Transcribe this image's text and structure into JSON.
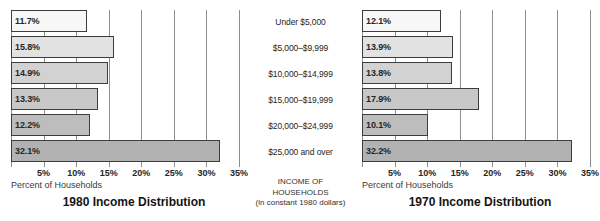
{
  "axis": {
    "ticks": [
      "5%",
      "10%",
      "15%",
      "20%",
      "25%",
      "30%",
      "35%"
    ],
    "tick_values": [
      5,
      10,
      15,
      20,
      25,
      30,
      35
    ],
    "caption": "Percent of Households",
    "min": 0,
    "max": 35
  },
  "center": {
    "categories": [
      "Under $5,000",
      "$5,000–$9,999",
      "$10,000–$14,999",
      "$15,000–$19,999",
      "$20,000–$24,999",
      "$25,000 and over"
    ],
    "footer_line1": "INCOME OF",
    "footer_line2": "HOUSEHOLDS",
    "footer_line3": "(in constant 1980 dollars)"
  },
  "left_chart": {
    "title": "1980 Income Distribution",
    "labels": [
      "11.7%",
      "15.8%",
      "14.9%",
      "13.3%",
      "12.2%",
      "32.1%"
    ]
  },
  "right_chart": {
    "title": "1970 Income Distribution",
    "labels": [
      "12.1%",
      "13.9%",
      "13.8%",
      "17.9%",
      "10.1%",
      "32.2%"
    ]
  },
  "chart_data": [
    {
      "type": "bar",
      "orientation": "horizontal",
      "title": "1980 Income Distribution",
      "xlabel": "Percent of Households",
      "ylabel": "INCOME OF HOUSEHOLDS (in constant 1980 dollars)",
      "categories": [
        "Under $5,000",
        "$5,000–$9,999",
        "$10,000–$14,999",
        "$15,000–$19,999",
        "$20,000–$24,999",
        "$25,000 and over"
      ],
      "values": [
        11.7,
        15.8,
        14.9,
        13.3,
        12.2,
        32.1
      ],
      "data_labels": [
        "11.7%",
        "15.8%",
        "14.9%",
        "13.3%",
        "12.2%",
        "32.1%"
      ],
      "bar_colors": [
        "#f7f7f7",
        "#e2e2e2",
        "#d2d2d2",
        "#c8c8c8",
        "#bdbdbd",
        "#b2b2b2"
      ],
      "xlim": [
        0,
        35
      ],
      "xticks": [
        5,
        10,
        15,
        20,
        25,
        30,
        35
      ],
      "xticklabels": [
        "5%",
        "10%",
        "15%",
        "20%",
        "25%",
        "30%",
        "35%"
      ],
      "grid": true,
      "legend": "none"
    },
    {
      "type": "bar",
      "orientation": "horizontal",
      "title": "1970 Income Distribution",
      "xlabel": "Percent of Households",
      "ylabel": "INCOME OF HOUSEHOLDS (in constant 1980 dollars)",
      "categories": [
        "Under $5,000",
        "$5,000–$9,999",
        "$10,000–$14,999",
        "$15,000–$19,999",
        "$20,000–$24,999",
        "$25,000 and over"
      ],
      "values": [
        12.1,
        13.9,
        13.8,
        17.9,
        10.1,
        32.2
      ],
      "data_labels": [
        "12.1%",
        "13.9%",
        "13.8%",
        "17.9%",
        "10.1%",
        "32.2%"
      ],
      "bar_colors": [
        "#f7f7f7",
        "#e2e2e2",
        "#d2d2d2",
        "#c8c8c8",
        "#bdbdbd",
        "#b2b2b2"
      ],
      "xlim": [
        0,
        35
      ],
      "xticks": [
        5,
        10,
        15,
        20,
        25,
        30,
        35
      ],
      "xticklabels": [
        "5%",
        "10%",
        "15%",
        "20%",
        "25%",
        "30%",
        "35%"
      ],
      "grid": true,
      "legend": "none"
    }
  ]
}
